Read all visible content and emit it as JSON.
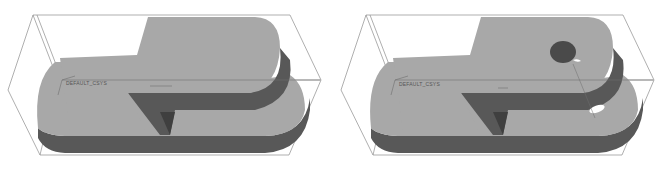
{
  "colors": {
    "background": "#ffffff",
    "top_face": "#a8a8a8",
    "side_face": "#585858",
    "inner_face": "#4a4a4a",
    "bbox_line": "#8c8c8c",
    "csys_line": "#6e6e6e"
  },
  "views": [
    {
      "name": "model-before-hole",
      "csys_label": "DEFAULT_CSYS",
      "has_hole": false
    },
    {
      "name": "model-after-hole",
      "csys_label": "DEFAULT_CSYS",
      "has_hole": true
    }
  ]
}
